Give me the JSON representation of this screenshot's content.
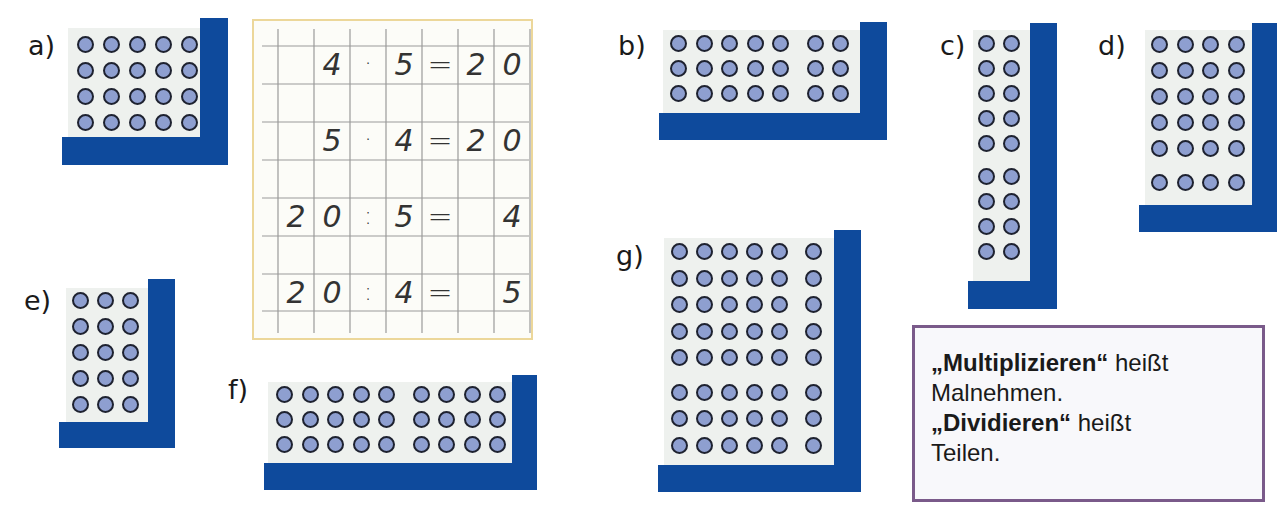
{
  "colors": {
    "board_blue": "#0e4a9c",
    "panel": "#eef1ee",
    "dot_fill": "#8e9fd0",
    "dot_stroke": "#1e2230",
    "grid_border": "#ecd79a",
    "info_border": "#7a5a8a"
  },
  "boards": [
    {
      "id": "a",
      "label": "a)",
      "rows": 4,
      "cols": 5,
      "row_groups": [
        4
      ],
      "col_groups": [
        5
      ]
    },
    {
      "id": "b",
      "label": "b)",
      "rows": 3,
      "cols": 7,
      "row_groups": [
        3
      ],
      "col_groups": [
        5,
        2
      ]
    },
    {
      "id": "c",
      "label": "c)",
      "rows": 9,
      "cols": 2,
      "row_groups": [
        5,
        4
      ],
      "col_groups": [
        2
      ]
    },
    {
      "id": "d",
      "label": "d)",
      "rows": 6,
      "cols": 4,
      "row_groups": [
        5,
        1
      ],
      "col_groups": [
        4
      ]
    },
    {
      "id": "e",
      "label": "e)",
      "rows": 5,
      "cols": 3,
      "row_groups": [
        5
      ],
      "col_groups": [
        3
      ]
    },
    {
      "id": "f",
      "label": "f)",
      "rows": 3,
      "cols": 9,
      "row_groups": [
        3
      ],
      "col_groups": [
        5,
        4
      ]
    },
    {
      "id": "g",
      "label": "g)",
      "rows": 8,
      "cols": 6,
      "row_groups": [
        5,
        3
      ],
      "col_groups": [
        5,
        1
      ]
    }
  ],
  "labels": {
    "a": "a)",
    "b": "b)",
    "c": "c)",
    "d": "d)",
    "e": "e)",
    "f": "f)",
    "g": "g)"
  },
  "worked_example": {
    "rows": [
      [
        "",
        "4",
        "·",
        "5",
        "=",
        "2",
        "0"
      ],
      [
        "",
        "5",
        "·",
        "4",
        "=",
        "2",
        "0"
      ],
      [
        "2",
        "0",
        ":",
        "5",
        "=",
        "",
        "4"
      ],
      [
        "2",
        "0",
        ":",
        "4",
        "=",
        "",
        "5"
      ]
    ],
    "equations": [
      "4 · 5 = 20",
      "5 · 4 = 20",
      "20 : 5 = 4",
      "20 : 4 = 5"
    ]
  },
  "info_box": {
    "term1": "„Multiplizieren“",
    "text1": " heißt",
    "text2": "Malnehmen.",
    "term2": "„Dividieren“",
    "text3": " heißt",
    "text4": "Teilen."
  }
}
